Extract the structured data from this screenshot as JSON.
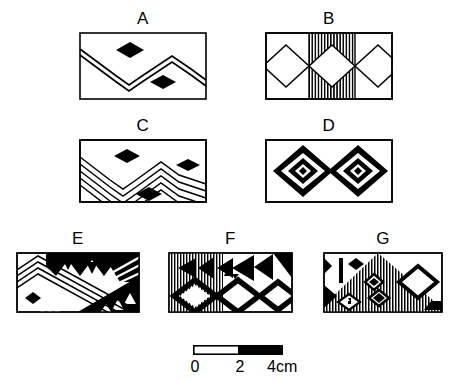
{
  "figure": {
    "type": "archaeological-motif-plate",
    "background_color": "#ffffff",
    "ink_color": "#000000",
    "panels": [
      {
        "id": "A",
        "label": "A",
        "description": "Rectangular panel with a double-line zigzag band and two solid black diamonds",
        "motifs": [
          "double-zigzag-line",
          "solid-diamond",
          "solid-diamond"
        ],
        "fill": "outline",
        "x": 79,
        "y": 32,
        "w": 128,
        "h": 68
      },
      {
        "id": "B",
        "label": "B",
        "description": "Rectangular panel with a central vertically hatched band crossed by three open diamonds",
        "motifs": [
          "vertical-hatch-band",
          "open-diamond",
          "open-diamond",
          "open-diamond"
        ],
        "fill": "hatched-center",
        "x": 265,
        "y": 32,
        "w": 128,
        "h": 68
      },
      {
        "id": "C",
        "label": "C",
        "description": "Rectangular panel with five nested zigzag lines and three solid black diamonds",
        "motifs": [
          "nested-zigzag-lines",
          "solid-diamond",
          "solid-diamond",
          "solid-diamond"
        ],
        "fill": "outline",
        "x": 79,
        "y": 139,
        "w": 128,
        "h": 64
      },
      {
        "id": "D",
        "label": "D",
        "description": "Rectangular panel with two concentric diamond motifs in solid black and white bands",
        "motifs": [
          "concentric-diamond",
          "concentric-diamond"
        ],
        "fill": "solid-bands",
        "x": 265,
        "y": 139,
        "w": 128,
        "h": 64
      },
      {
        "id": "E",
        "label": "E",
        "description": "Rectangular panel with diagonal line bands, black sawtooth triangle rows and a small solid diamond",
        "motifs": [
          "diagonal-line-bands",
          "sawtooth-triangles",
          "solid-diamond"
        ],
        "fill": "solid-and-outline",
        "x": 16,
        "y": 252,
        "w": 124,
        "h": 61
      },
      {
        "id": "F",
        "label": "F",
        "description": "Rectangular panel with vertical hatching at left, rows of black triangles pointing left and thick open diamonds below",
        "motifs": [
          "vertical-hatch-field",
          "left-pointing-triangles",
          "thick-open-diamond",
          "thick-open-diamond",
          "thick-open-diamond"
        ],
        "fill": "hatched-left",
        "x": 168,
        "y": 252,
        "w": 125,
        "h": 61
      },
      {
        "id": "G",
        "label": "G",
        "description": "Rectangular panel with a large vertically hatched triangle, inset diamonds, a black vertical bar and a large open diamond at right",
        "motifs": [
          "hatched-triangle",
          "vertical-bar",
          "solid-diamond",
          "inset-diamonds",
          "large-open-diamond"
        ],
        "fill": "hatched-triangle",
        "x": 323,
        "y": 252,
        "w": 120,
        "h": 61
      }
    ]
  },
  "scale": {
    "name": "scale-bar",
    "unit": "cm",
    "total_length_cm": 4,
    "ticks": [
      "0",
      "2",
      "4cm"
    ],
    "segments": [
      {
        "from_cm": 0,
        "to_cm": 2,
        "fill": "white"
      },
      {
        "from_cm": 2,
        "to_cm": 4,
        "fill": "black"
      }
    ],
    "bar_x": 193,
    "bar_y": 345,
    "bar_w": 90,
    "bar_h": 9
  }
}
